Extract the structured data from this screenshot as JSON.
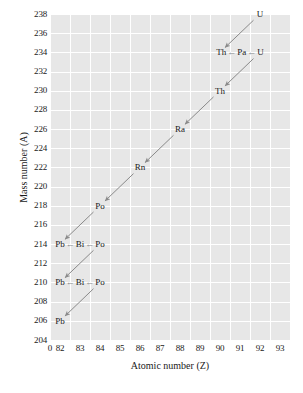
{
  "chart_data": {
    "type": "scatter",
    "title": "",
    "xlabel": "Atomic number (Z)",
    "ylabel": "Mass number (A)",
    "xlim": [
      81.5,
      93.5
    ],
    "ylim": [
      204,
      239
    ],
    "grid": true,
    "legend": "none",
    "xticks": [
      "0",
      "82",
      "83",
      "84",
      "85",
      "86",
      "87",
      "88",
      "89",
      "90",
      "91",
      "92",
      "93"
    ],
    "yticks": [
      "238",
      "236",
      "234",
      "232",
      "230",
      "228",
      "226",
      "224",
      "222",
      "220",
      "218",
      "216",
      "214",
      "212",
      "210",
      "208",
      "206",
      "204"
    ],
    "axis_break": "0",
    "series": [
      {
        "name": "Uranium-238 decay series",
        "points": [
          {
            "label": "U",
            "z": 92,
            "a": 238
          },
          {
            "label": "Th",
            "z": 90,
            "a": 234
          },
          {
            "label": "Pa",
            "z": 91,
            "a": 234
          },
          {
            "label": "U",
            "z": 92,
            "a": 234
          },
          {
            "label": "Th",
            "z": 90,
            "a": 230
          },
          {
            "label": "Ra",
            "z": 88,
            "a": 226
          },
          {
            "label": "Rn",
            "z": 86,
            "a": 222
          },
          {
            "label": "Po",
            "z": 84,
            "a": 218
          },
          {
            "label": "Pb",
            "z": 82,
            "a": 214
          },
          {
            "label": "Bi",
            "z": 83,
            "a": 214
          },
          {
            "label": "Po",
            "z": 84,
            "a": 214
          },
          {
            "label": "Pb",
            "z": 82,
            "a": 210
          },
          {
            "label": "Bi",
            "z": 83,
            "a": 210
          },
          {
            "label": "Po",
            "z": 84,
            "a": 210
          },
          {
            "label": "Pb",
            "z": 82,
            "a": 206
          }
        ]
      }
    ],
    "chain_rows": [
      {
        "a": 234,
        "items": [
          "Th",
          "Pa",
          "U"
        ],
        "arrow": "←"
      },
      {
        "a": 214,
        "items": [
          "Pb",
          "Bi",
          "Po"
        ],
        "arrow": "←"
      },
      {
        "a": 210,
        "items": [
          "Pb",
          "Bi",
          "Po"
        ],
        "arrow": "←"
      }
    ],
    "alpha_decay_arrows": [
      {
        "from": {
          "z": 92,
          "a": 238
        },
        "to": {
          "z": 90,
          "a": 234
        }
      },
      {
        "from": {
          "z": 92,
          "a": 234
        },
        "to": {
          "z": 90,
          "a": 230
        }
      },
      {
        "from": {
          "z": 90,
          "a": 230
        },
        "to": {
          "z": 88,
          "a": 226
        }
      },
      {
        "from": {
          "z": 88,
          "a": 226
        },
        "to": {
          "z": 86,
          "a": 222
        }
      },
      {
        "from": {
          "z": 86,
          "a": 222
        },
        "to": {
          "z": 84,
          "a": 218
        }
      },
      {
        "from": {
          "z": 84,
          "a": 218
        },
        "to": {
          "z": 82,
          "a": 214
        }
      },
      {
        "from": {
          "z": 84,
          "a": 214
        },
        "to": {
          "z": 82,
          "a": 210
        }
      },
      {
        "from": {
          "z": 84,
          "a": 210
        },
        "to": {
          "z": 82,
          "a": 206
        }
      }
    ],
    "colors": {
      "plot_background": "#e7e7e7",
      "gridline": "#ffffff",
      "arrow": "#8a8a8a",
      "text": "#1a1a1a",
      "page_background": "#ffffff"
    }
  }
}
